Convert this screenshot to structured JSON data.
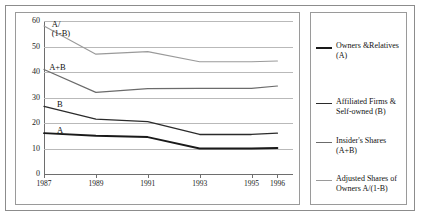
{
  "chart_data": {
    "type": "line",
    "title": "",
    "xlabel": "",
    "ylabel": "",
    "x": [
      1987,
      1989,
      1991,
      1993,
      1995,
      1996
    ],
    "xlim": [
      1987,
      1996.6
    ],
    "ylim": [
      0,
      60
    ],
    "ytick_labels": [
      "0",
      "10",
      "20",
      "30",
      "40",
      "50",
      "60"
    ],
    "yticks": [
      0,
      10,
      20,
      30,
      40,
      50,
      60
    ],
    "xtick_labels": [
      "1987",
      "1989",
      "1991",
      "1993",
      "1995",
      "1996"
    ],
    "grid": "horizontal",
    "legend_position": "right",
    "series": [
      {
        "name": "Owners &Relatives (A)",
        "short": "A",
        "color": "#1a1a1a",
        "width": 1.8,
        "values": [
          16.0,
          15.0,
          14.5,
          10.0,
          10.0,
          10.2
        ]
      },
      {
        "name": "Affiliated Firms & Self-owned (B)",
        "short": "B",
        "color": "#2b2b2b",
        "width": 1.3,
        "values": [
          26.5,
          21.5,
          20.5,
          15.5,
          15.5,
          16.0
        ]
      },
      {
        "name": "Insider's Shares (A+B)",
        "short": "A+B",
        "color": "#6b6b6b",
        "width": 1.2,
        "values": [
          41.0,
          32.0,
          33.5,
          33.6,
          33.6,
          34.5
        ]
      },
      {
        "name": "Adjusted Shares of Owners A/(1-B)",
        "short": "A/(1-B)",
        "color": "#9a9a9a",
        "width": 1.1,
        "values": [
          58.0,
          47.0,
          48.0,
          44.0,
          44.0,
          44.3
        ]
      }
    ],
    "annotations": [
      {
        "text_line1": "A/",
        "text_line2": "(1-B)",
        "x": 1987.3,
        "y": 57.0
      },
      {
        "text_line1": "A+B",
        "text_line2": "",
        "x": 1987.2,
        "y": 41.5
      },
      {
        "text_line1": "B",
        "text_line2": "",
        "x": 1987.5,
        "y": 27.0
      },
      {
        "text_line1": "A",
        "text_line2": "",
        "x": 1987.5,
        "y": 17.0
      }
    ]
  },
  "legend": {
    "entries": [
      {
        "label_line1": "Owners &Relatives (A)",
        "label_line2": "",
        "color": "#1a1a1a",
        "thickness": "2.6px"
      },
      {
        "label_line1": "Affiliated Firms &",
        "label_line2": "Self-owned (B)",
        "color": "#2b2b2b",
        "thickness": "1.8px"
      },
      {
        "label_line1": "Insider's Shares (A+B)",
        "label_line2": "",
        "color": "#6b6b6b",
        "thickness": "1.5px"
      },
      {
        "label_line1": "Adjusted Shares of",
        "label_line2": "Owners A/(1-B)",
        "color": "#9a9a9a",
        "thickness": "1.2px"
      }
    ]
  }
}
